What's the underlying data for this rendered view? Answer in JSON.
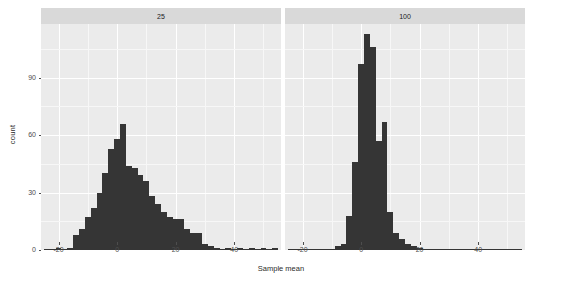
{
  "chart_data": {
    "type": "bar",
    "subtype": "histogram-facet",
    "title": "",
    "subtitle": "",
    "xlabel": "Sample mean",
    "ylabel": "count",
    "grid": true,
    "legend": false,
    "legend_position": "none",
    "xlim": [
      -26,
      56
    ],
    "ylim": [
      0,
      118
    ],
    "xticks": [
      -20,
      0,
      20,
      40
    ],
    "yticks": [
      0,
      30,
      60,
      90
    ],
    "xtick_labels": [
      "-20",
      "0",
      "20",
      "40"
    ],
    "ytick_labels": [
      "0",
      "30",
      "60",
      "90"
    ],
    "bar_color": "#353535",
    "panel_bg": "#ebebeb",
    "strip_bg": "#d9d9d9",
    "grid_color": "#ffffff",
    "binwidth": 2,
    "panels": [
      {
        "label": "25",
        "facet_var": "n",
        "x": [
          -24,
          -22,
          -20,
          -18,
          -16,
          -14,
          -12,
          -10,
          -8,
          -6,
          -4,
          -2,
          0,
          2,
          4,
          6,
          8,
          10,
          12,
          14,
          16,
          18,
          20,
          22,
          24,
          26,
          28,
          30,
          32,
          34,
          36,
          38,
          40,
          42,
          44,
          46,
          48,
          50,
          52,
          54
        ],
        "values": [
          0,
          0,
          1,
          0,
          1,
          8,
          11,
          17,
          22,
          30,
          40,
          53,
          58,
          66,
          44,
          43,
          39,
          36,
          28,
          24,
          20,
          17,
          16,
          16,
          11,
          9,
          9,
          3,
          2,
          1,
          0,
          1,
          0,
          1,
          0,
          1,
          0,
          1,
          0,
          1
        ]
      },
      {
        "label": "100",
        "facet_var": "n",
        "x": [
          -24,
          -22,
          -20,
          -18,
          -16,
          -14,
          -12,
          -10,
          -8,
          -6,
          -4,
          -2,
          0,
          2,
          4,
          6,
          8,
          10,
          12,
          14,
          16,
          18,
          20,
          22,
          24,
          26,
          28,
          30,
          32,
          34,
          36,
          38,
          40,
          42,
          44,
          46,
          48,
          50,
          52,
          54
        ],
        "values": [
          0,
          0,
          0,
          0,
          0,
          0,
          0,
          0,
          2,
          3,
          18,
          46,
          97,
          113,
          106,
          57,
          67,
          20,
          9,
          6,
          3,
          2,
          1,
          0,
          0,
          0,
          0,
          0,
          0,
          0,
          0,
          0,
          0,
          0,
          0,
          0,
          0,
          0,
          0,
          0
        ]
      }
    ]
  },
  "axis": {
    "y_label": "count",
    "x_label": "Sample mean"
  }
}
